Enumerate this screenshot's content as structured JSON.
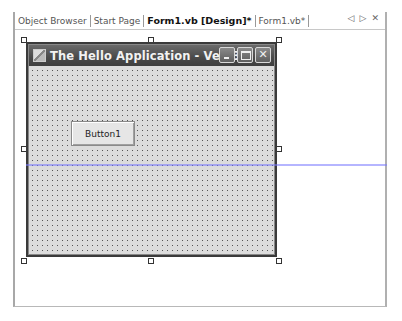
{
  "tabs": [
    {
      "label": "Object Browser",
      "active": false
    },
    {
      "label": "Start Page",
      "active": false
    },
    {
      "label": "Form1.vb [Design]*",
      "active": true
    },
    {
      "label": "Form1.vb*",
      "active": false
    }
  ],
  "tab_nav": {
    "prev_icon": "◁",
    "next_icon": "▷",
    "close_icon": "✕"
  },
  "form": {
    "title": "The Hello Application - Ver. 3.0",
    "close_glyph": "✕",
    "controls": [
      {
        "type": "button",
        "label": "Button1"
      }
    ]
  },
  "colors": {
    "guideline": "#7878ff",
    "form_background": "#dcdcdc",
    "titlebar": "#4a4a4a"
  }
}
